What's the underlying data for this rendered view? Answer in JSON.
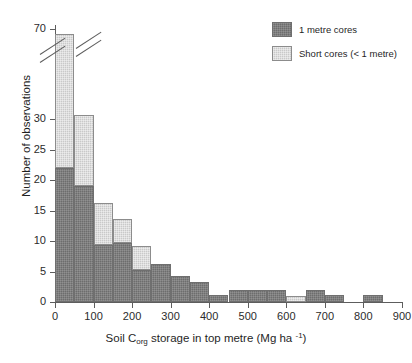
{
  "chart_data": {
    "type": "bar",
    "subtype": "stacked-histogram",
    "title": "",
    "xlabel": "Soil Corg storage in top metre (Mg ha -1)",
    "xlabel_parts": {
      "pre": "Soil C",
      "sub": "org",
      "mid": " storage in top metre (Mg ha ",
      "sup": "-1",
      "post": ")"
    },
    "ylabel": "Number of observations",
    "xlim": [
      0,
      900
    ],
    "ylim": [
      0,
      70
    ],
    "grid": false,
    "bin_width": 50,
    "y_axis_break": {
      "present": true,
      "from": 30,
      "to": 70
    },
    "xticks": [
      0,
      100,
      200,
      300,
      400,
      500,
      600,
      700,
      800,
      900
    ],
    "yticks": [
      0,
      5,
      10,
      15,
      20,
      25,
      30,
      70
    ],
    "legend_position": "top-right",
    "categories": [
      "0-50",
      "50-100",
      "100-150",
      "150-200",
      "200-250",
      "250-300",
      "300-350",
      "350-400",
      "400-450",
      "450-500",
      "500-550",
      "550-600",
      "600-650",
      "650-700",
      "700-750",
      "750-800",
      "800-850",
      "850-900"
    ],
    "bin_starts": [
      0,
      50,
      100,
      150,
      200,
      250,
      300,
      350,
      400,
      450,
      500,
      550,
      600,
      650,
      700,
      750,
      800,
      850
    ],
    "series": [
      {
        "name": "1 metre cores",
        "color": "#6d6d6d",
        "values": [
          22,
          19,
          9.3,
          9.6,
          5.2,
          6.2,
          4.2,
          3.2,
          1.2,
          2,
          2,
          2,
          0,
          2,
          1.2,
          0,
          1.2,
          0
        ]
      },
      {
        "name": "Short cores (< 1 metre)",
        "color": "#c9c9c9",
        "values": [
          46,
          13,
          7,
          4,
          4,
          0,
          0,
          0,
          0,
          0,
          0,
          0,
          1,
          0,
          0,
          0,
          0,
          0
        ]
      }
    ],
    "totals": [
      68,
      32,
      16.3,
      13.6,
      9.2,
      6.2,
      4.2,
      3.2,
      1.2,
      2,
      2,
      2,
      1,
      2,
      1.2,
      0,
      1.2,
      0
    ]
  },
  "legend": {
    "items": [
      {
        "label": "1 metre cores",
        "swatch": "dark"
      },
      {
        "label": "Short cores (< 1 metre)",
        "swatch": "light"
      }
    ]
  }
}
